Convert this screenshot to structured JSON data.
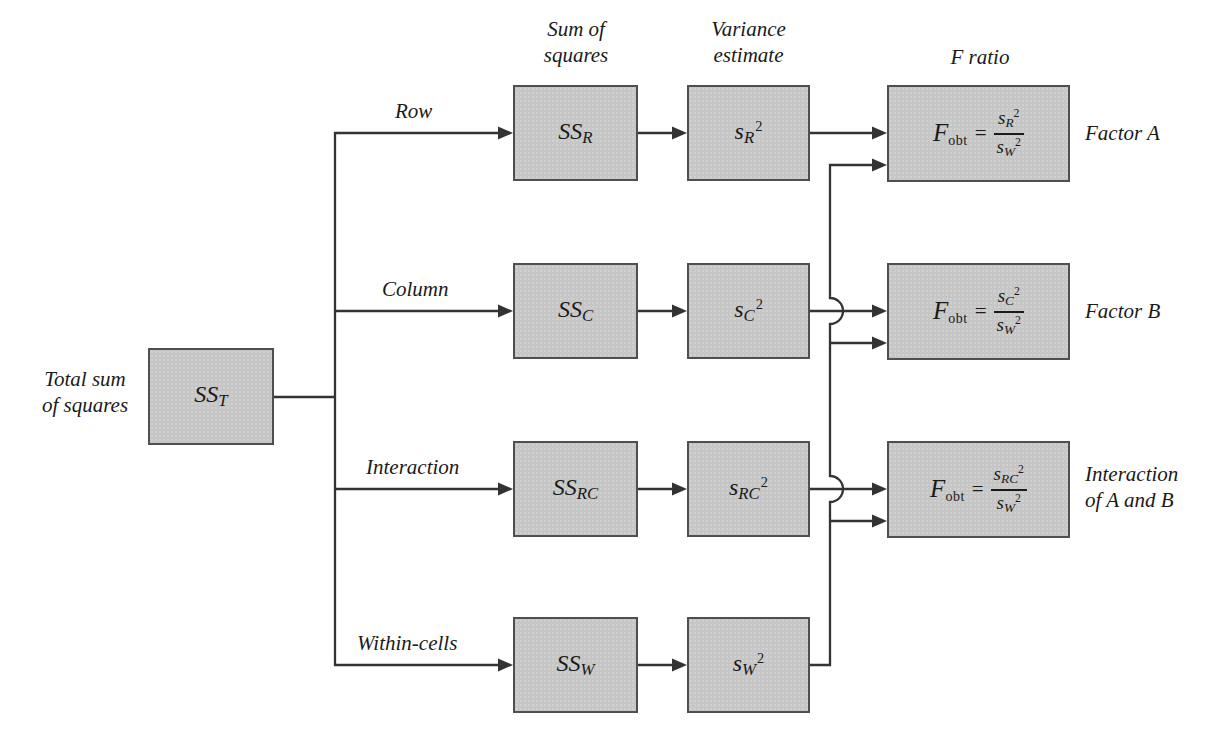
{
  "headers": {
    "sum_of_squares": [
      "Sum of",
      "squares"
    ],
    "variance_estimate": [
      "Variance",
      "estimate"
    ],
    "f_ratio": "F ratio"
  },
  "total": {
    "label": [
      "Total sum",
      "of squares"
    ],
    "symbol": {
      "base": "SS",
      "sub": "T"
    }
  },
  "rows": [
    {
      "branch_label": "Row",
      "ss": {
        "base": "SS",
        "sub": "R"
      },
      "variance": {
        "base": "s",
        "sub": "R",
        "sup": "2"
      },
      "f": {
        "base": "F",
        "sub": "obt",
        "eq": "=",
        "num": {
          "base": "s",
          "sub": "R",
          "sup": "2"
        },
        "den": {
          "base": "s",
          "sub": "W",
          "sup": "2"
        }
      },
      "result_label": [
        "Factor A"
      ]
    },
    {
      "branch_label": "Column",
      "ss": {
        "base": "SS",
        "sub": "C"
      },
      "variance": {
        "base": "s",
        "sub": "C",
        "sup": "2"
      },
      "f": {
        "base": "F",
        "sub": "obt",
        "eq": "=",
        "num": {
          "base": "s",
          "sub": "C",
          "sup": "2"
        },
        "den": {
          "base": "s",
          "sub": "W",
          "sup": "2"
        }
      },
      "result_label": [
        "Factor B"
      ]
    },
    {
      "branch_label": "Interaction",
      "ss": {
        "base": "SS",
        "sub": "RC"
      },
      "variance": {
        "base": "s",
        "sub": "RC",
        "sup": "2"
      },
      "f": {
        "base": "F",
        "sub": "obt",
        "eq": "=",
        "num": {
          "base": "s",
          "sub": "RC",
          "sup": "2"
        },
        "den": {
          "base": "s",
          "sub": "W",
          "sup": "2"
        }
      },
      "result_label": [
        "Interaction",
        "of A and B"
      ]
    },
    {
      "branch_label": "Within-cells",
      "ss": {
        "base": "SS",
        "sub": "W"
      },
      "variance": {
        "base": "s",
        "sub": "W",
        "sup": "2"
      }
    }
  ],
  "colors": {
    "bg": "#ffffff",
    "box_fill": "#c6c6c6",
    "box_border": "#4f4f4f",
    "line": "#333333",
    "text": "#1a1a1a"
  }
}
